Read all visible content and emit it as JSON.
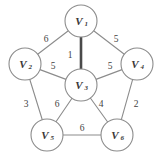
{
  "figure": {
    "title": "",
    "background_color": "#ffffff",
    "width": 164,
    "height": 160
  },
  "style": {
    "edge_color": "#8c8c8c",
    "bold_edge_color": "#4a4a4a",
    "node_fill": "#ffffff",
    "node_stroke": "#8c8c8c",
    "label_color": "#3a3a3a",
    "weight_color": "#3f3f3f"
  },
  "chart_data": {
    "type": "diagram",
    "diagram_kind": "weighted-undirected-graph",
    "title": "",
    "xlabel": "",
    "ylabel": "",
    "nodes": [
      {
        "id": "V1",
        "label": "V",
        "subscript": "1",
        "x": 81,
        "y": 21,
        "r": 16
      },
      {
        "id": "V2",
        "label": "V",
        "subscript": "2",
        "x": 25,
        "y": 64,
        "r": 16
      },
      {
        "id": "V3",
        "label": "V",
        "subscript": "3",
        "x": 81,
        "y": 85,
        "r": 16
      },
      {
        "id": "V4",
        "label": "V",
        "subscript": "4",
        "x": 137,
        "y": 64,
        "r": 16
      },
      {
        "id": "V5",
        "label": "V",
        "subscript": "5",
        "x": 47,
        "y": 135,
        "r": 16
      },
      {
        "id": "V6",
        "label": "V",
        "subscript": "6",
        "x": 117,
        "y": 135,
        "r": 16
      }
    ],
    "edges": [
      {
        "source": "V1",
        "target": "V2",
        "weight": 6,
        "bold": false,
        "label_x": 46,
        "label_y": 39
      },
      {
        "source": "V1",
        "target": "V4",
        "weight": 5,
        "bold": false,
        "label_x": 116,
        "label_y": 39
      },
      {
        "source": "V1",
        "target": "V3",
        "weight": 1,
        "bold": true,
        "label_x": 70,
        "label_y": 55
      },
      {
        "source": "V2",
        "target": "V3",
        "weight": 5,
        "bold": false,
        "label_x": 53,
        "label_y": 66
      },
      {
        "source": "V3",
        "target": "V4",
        "weight": 5,
        "bold": false,
        "label_x": 110,
        "label_y": 66
      },
      {
        "source": "V2",
        "target": "V5",
        "weight": 3,
        "bold": false,
        "label_x": 26,
        "label_y": 104
      },
      {
        "source": "V3",
        "target": "V5",
        "weight": 6,
        "bold": false,
        "label_x": 57,
        "label_y": 104
      },
      {
        "source": "V3",
        "target": "V6",
        "weight": 4,
        "bold": false,
        "label_x": 101,
        "label_y": 104
      },
      {
        "source": "V4",
        "target": "V6",
        "weight": 2,
        "bold": false,
        "label_x": 136,
        "label_y": 104
      },
      {
        "source": "V5",
        "target": "V6",
        "weight": 6,
        "bold": false,
        "label_x": 82,
        "label_y": 128
      }
    ],
    "node_labels": [
      "V1",
      "V2",
      "V3",
      "V4",
      "V5",
      "V6"
    ],
    "weights": [
      6,
      5,
      1,
      5,
      5,
      3,
      6,
      4,
      2,
      6
    ],
    "legend": [],
    "annotations": []
  }
}
